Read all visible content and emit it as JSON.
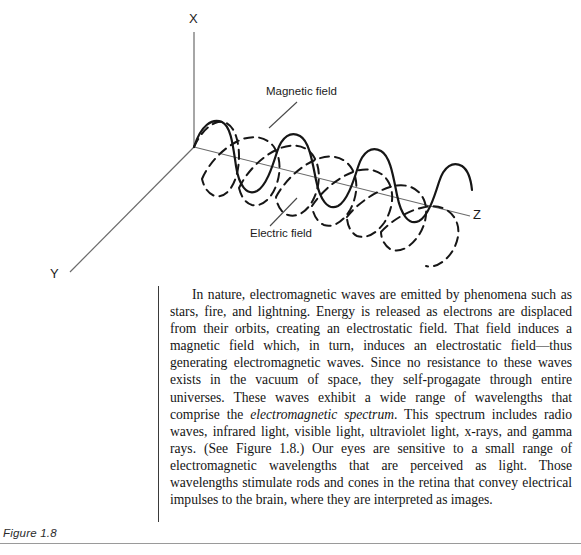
{
  "figure": {
    "caption": "Figure 1.8",
    "diagram": {
      "name": "electromagnetic-wave-3d-axes",
      "axes": [
        {
          "id": "x",
          "label": "X"
        },
        {
          "id": "y",
          "label": "Y"
        },
        {
          "id": "z",
          "label": "Z"
        }
      ],
      "annotations": [
        {
          "id": "magnetic",
          "label": "Magnetic field",
          "style": "dashed"
        },
        {
          "id": "electric",
          "label": "Electric field",
          "style": "solid"
        }
      ],
      "colors": {
        "axis": "#6b6b6b",
        "wave": "#161616",
        "text": "#1c1c1c",
        "rule": "#9a9a9a"
      }
    }
  },
  "body": {
    "paragraph_parts": [
      {
        "text": "In nature, electromagnetic waves are emitted by phenomena such as stars, fire, and lightning. Energy is released as electrons are displaced from their orbits, creating an electrostatic field. That field induces a magnetic field which, in turn, induces an electrostatic field—thus generating electromagnetic waves. Since no resistance to these waves exists in the vacuum of space, they self-progagate through entire universes. These waves exhibit a wide range of wavelengths that comprise the ",
        "italic": false
      },
      {
        "text": "electromagnetic spectrum",
        "italic": true
      },
      {
        "text": ". This spectrum includes radio waves, infrared light, visible light, ultraviolet light, x-rays, and gamma rays. (See Figure 1.8.) Our eyes are sensitive to a small range of electromagnetic wavelengths that are perceived as light. Those wavelengths stimulate rods and cones in the retina that convey electrical impulses to the brain, where they are interpreted as images.",
        "italic": false
      }
    ]
  }
}
